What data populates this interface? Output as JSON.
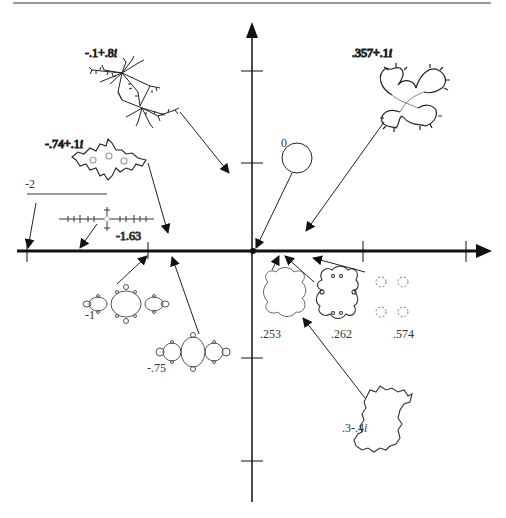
{
  "figure": {
    "axes": {
      "horizontal": "real axis",
      "vertical": "imaginary axis",
      "origin_px": [
        252,
        250
      ]
    },
    "top_rule": true
  },
  "julia_sets": [
    {
      "id": "c-neg0_1-plus-0_8i",
      "label_re": "-.1+.8",
      "label_im": "i",
      "c": "-0.1+0.8i",
      "shape": "dendrite-rabbit"
    },
    {
      "id": "c-0_357-plus-0_1i",
      "label_re": ".357+.1",
      "label_im": "i",
      "c": "0.357+0.1i",
      "shape": "seahorse-spirals"
    },
    {
      "id": "c-neg0_74-plus-0_1i",
      "label_re": "-.74+.1",
      "label_im": "i",
      "c": "-0.74+0.1i",
      "shape": "basilica-warped"
    },
    {
      "id": "c-0",
      "label": "0",
      "c": "0",
      "shape": "circle"
    },
    {
      "id": "c-neg2",
      "label": "-2",
      "c": "-2",
      "shape": "line-segment"
    },
    {
      "id": "c-neg1_63",
      "label": "-1.63",
      "c": "-1.63",
      "shape": "dust-cross"
    },
    {
      "id": "c-neg1",
      "label": "-1",
      "c": "-1",
      "shape": "basilica"
    },
    {
      "id": "c-neg0_75",
      "label": "-.75",
      "c": "-0.75",
      "shape": "san-marco"
    },
    {
      "id": "c-0_253",
      "label": ".253",
      "c": "0.253",
      "shape": "cauliflower"
    },
    {
      "id": "c-0_262",
      "label": ".262",
      "c": "0.262",
      "shape": "cauliflower-spirals"
    },
    {
      "id": "c-0_574",
      "label": ".574",
      "c": "0.574",
      "shape": "cantor-dust"
    },
    {
      "id": "c-0_3-minus-0_4i",
      "label_re": ".3-.4",
      "label_im": "i",
      "c": "0.3-0.4i",
      "shape": "irregular-blob"
    }
  ]
}
